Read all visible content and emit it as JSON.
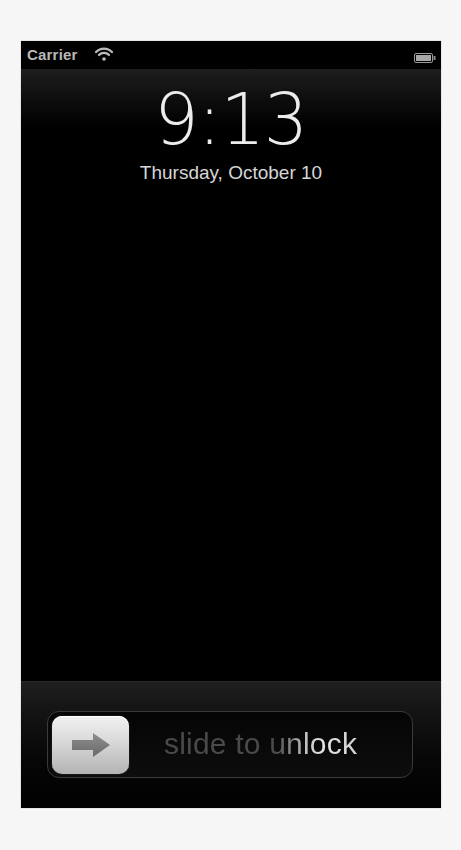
{
  "status_bar": {
    "carrier": "Carrier",
    "wifi_icon": "wifi-icon",
    "battery_icon": "battery-icon",
    "battery_level_pct": 100
  },
  "lock_screen": {
    "time": "9:13",
    "date": "Thursday, October 10"
  },
  "unlock_slider": {
    "label": "slide to unlock",
    "knob_icon": "arrow-right-icon"
  },
  "colors": {
    "background": "#000000",
    "text_primary": "#ececec",
    "status_text": "#b9b9b9",
    "slider_text_dim": "#4a4a4a",
    "slider_text_highlight": "#e6e6e6",
    "knob": "#d8d8d8"
  }
}
